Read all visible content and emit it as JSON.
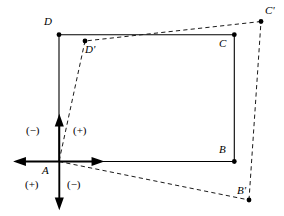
{
  "figure": {
    "background_color": "#ffffff",
    "stroke_color": "#000000",
    "width": 284,
    "height": 216
  },
  "axes": {
    "origin": {
      "x": 59.3,
      "y": 161.5
    },
    "vertical": {
      "x": 59.3,
      "y_top": 117,
      "y_bottom": 207,
      "arrow_top": true,
      "arrow_bottom": true
    },
    "horizontal": {
      "y": 161.5,
      "x_left": 16.5,
      "x_right": 101,
      "arrow_left": true,
      "arrow_right": true
    }
  },
  "points": {
    "A": {
      "label": "A",
      "x": 59.0,
      "y": 161.5,
      "dot": false,
      "label_x": 43,
      "label_y": 165
    },
    "B": {
      "label": "B",
      "x": 234.3,
      "y": 161.5,
      "dot": true,
      "label_x": 219,
      "label_y": 145
    },
    "C": {
      "label": "C",
      "x": 234.3,
      "y": 34.7,
      "dot": true,
      "label_x": 219,
      "label_y": 38
    },
    "D": {
      "label": "D",
      "x": 59.0,
      "y": 34.7,
      "dot": true,
      "label_x": 44,
      "label_y": 16
    },
    "Bp": {
      "label": "B'",
      "x": 249.0,
      "y": 200.0,
      "dot": true,
      "label_x": 238,
      "label_y": 186
    },
    "Cp": {
      "label": "C'",
      "x": 261.0,
      "y": 21.5,
      "dot": true,
      "label_x": 265,
      "label_y": 7
    },
    "Dp": {
      "label": "D'",
      "x": 85.0,
      "y": 41.0,
      "dot": true,
      "label_x": 85,
      "label_y": 44
    }
  },
  "solid_figure": {
    "name": "rectangle-ABCD",
    "vertices": [
      "A",
      "B",
      "C",
      "D"
    ],
    "style": "solid"
  },
  "dashed_figure": {
    "name": "rotated-rectangle-AB'C'D'",
    "vertices": [
      "A",
      "Bp",
      "Cp",
      "Dp"
    ],
    "style": "dashed"
  },
  "sign_labels": [
    {
      "text": "(−)",
      "x": 26,
      "y": 126,
      "quadrant": "upper-left"
    },
    {
      "text": "(+)",
      "x": 73,
      "y": 126,
      "quadrant": "upper-right"
    },
    {
      "text": "(+)",
      "x": 26,
      "y": 180,
      "quadrant": "lower-left"
    },
    {
      "text": "(−)",
      "x": 67,
      "y": 180,
      "quadrant": "lower-right"
    }
  ]
}
